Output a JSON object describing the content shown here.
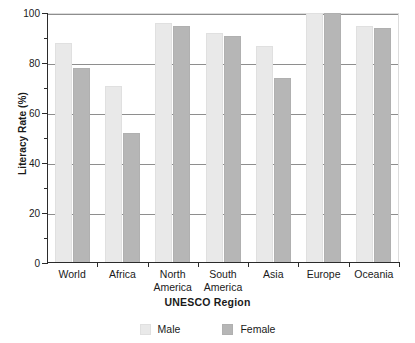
{
  "chart_data": {
    "type": "bar",
    "title": "",
    "xlabel": "UNESCO Region",
    "ylabel": "Literacy Rate (%)",
    "categories": [
      "World",
      "Africa",
      "North America",
      "South America",
      "Asia",
      "Europe",
      "Oceania"
    ],
    "category_lines": [
      [
        "World"
      ],
      [
        "Africa"
      ],
      [
        "North",
        "America"
      ],
      [
        "South",
        "America"
      ],
      [
        "Asia"
      ],
      [
        "Europe"
      ],
      [
        "Oceania"
      ]
    ],
    "series": [
      {
        "name": "Male",
        "color": "#e9e9e9",
        "values": [
          88,
          71,
          96,
          92,
          87,
          100,
          95
        ]
      },
      {
        "name": "Female",
        "color": "#b6b6b6",
        "values": [
          78,
          52,
          95,
          91,
          74,
          100,
          94
        ]
      }
    ],
    "ylim": [
      0,
      100
    ],
    "ytick_labels": [
      "0",
      "20",
      "40",
      "60",
      "80",
      "100"
    ],
    "ytick_values": [
      0,
      20,
      40,
      60,
      80,
      100
    ],
    "yminor_values": [
      10,
      30,
      50,
      70,
      90
    ],
    "grid": true,
    "grid_axis": "y",
    "legend_position": "bottom",
    "legend_entries": [
      "Male",
      "Female"
    ]
  }
}
